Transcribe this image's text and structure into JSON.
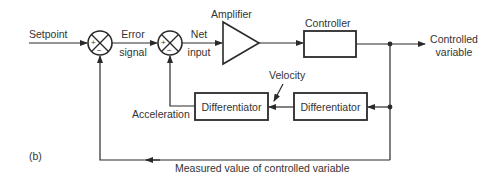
{
  "diagram": {
    "panel_label": "(b)",
    "inputs": {
      "setpoint": "Setpoint"
    },
    "signals": {
      "error_line1": "Error",
      "error_line2": "signal",
      "net_line1": "Net",
      "net_line2": "input",
      "velocity": "Velocity",
      "acceleration": "Acceleration",
      "output_line1": "Controlled",
      "output_line2": "variable",
      "feedback": "Measured value of controlled variable"
    },
    "blocks": {
      "amplifier": "Amplifier",
      "controller": "Controller",
      "differentiator_1": "Differentiator",
      "differentiator_2": "Differentiator"
    },
    "summing_junctions": [
      {
        "plus": "+",
        "minus": "−"
      },
      {
        "plus": "+",
        "minus": "−"
      }
    ],
    "colors": {
      "line": "#2a2a2a",
      "text": "#333333",
      "background": "#ffffff"
    }
  }
}
